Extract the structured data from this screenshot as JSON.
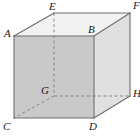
{
  "figure": {
    "name": "labelled-rectangular-box",
    "type": "geometry-diagram",
    "projection": "oblique",
    "canvas": {
      "width": 140,
      "height": 138
    },
    "colors": {
      "background": "#ffffff",
      "front_face": "#c9c9c9",
      "top_face": "#f2f2f2",
      "right_face": "#e0e0e0",
      "edge_visible": "#6e6e6e",
      "edge_hidden": "#8a8a8a",
      "label_text": "#1a1a1a"
    },
    "vertices": [
      {
        "id": "A",
        "label": "A",
        "x": 14,
        "y": 36,
        "hidden": false,
        "label_x": 4,
        "label_y": 28
      },
      {
        "id": "B",
        "label": "B",
        "x": 94,
        "y": 36,
        "hidden": false,
        "label_x": 88,
        "label_y": 24
      },
      {
        "id": "C",
        "label": "C",
        "x": 14,
        "y": 118,
        "hidden": false,
        "label_x": 3,
        "label_y": 121
      },
      {
        "id": "D",
        "label": "D",
        "x": 94,
        "y": 118,
        "hidden": false,
        "label_x": 89,
        "label_y": 121
      },
      {
        "id": "E",
        "label": "E",
        "x": 54,
        "y": 13,
        "hidden": false,
        "label_x": 49,
        "label_y": 1
      },
      {
        "id": "F",
        "label": "F",
        "x": 130,
        "y": 13,
        "hidden": false,
        "label_x": 133,
        "label_y": 0
      },
      {
        "id": "G",
        "label": "G",
        "x": 54,
        "y": 96,
        "hidden": true,
        "label_x": 41,
        "label_y": 85
      },
      {
        "id": "H",
        "label": "H",
        "x": 130,
        "y": 96,
        "hidden": false,
        "label_x": 133,
        "label_y": 88
      }
    ],
    "edges_visible": [
      {
        "from": "A",
        "to": "B",
        "name": "edge-a-b"
      },
      {
        "from": "B",
        "to": "D",
        "name": "edge-b-d"
      },
      {
        "from": "D",
        "to": "C",
        "name": "edge-d-c"
      },
      {
        "from": "C",
        "to": "A",
        "name": "edge-c-a"
      },
      {
        "from": "A",
        "to": "E",
        "name": "edge-a-e"
      },
      {
        "from": "B",
        "to": "F",
        "name": "edge-b-f"
      },
      {
        "from": "E",
        "to": "F",
        "name": "edge-e-f"
      },
      {
        "from": "D",
        "to": "H",
        "name": "edge-d-h"
      },
      {
        "from": "F",
        "to": "H",
        "name": "edge-f-h"
      }
    ],
    "edges_hidden": [
      {
        "from": "E",
        "to": "G",
        "name": "edge-e-g-dashed"
      },
      {
        "from": "G",
        "to": "C",
        "name": "edge-g-c-dashed"
      },
      {
        "from": "G",
        "to": "H",
        "name": "edge-g-h-dashed"
      }
    ],
    "faces": [
      {
        "name": "front-face",
        "vertices": [
          "A",
          "B",
          "D",
          "C"
        ],
        "fill": "#c9c9c9"
      },
      {
        "name": "top-face",
        "vertices": [
          "A",
          "E",
          "F",
          "B"
        ],
        "fill": "#f2f2f2"
      },
      {
        "name": "right-face",
        "vertices": [
          "B",
          "F",
          "H",
          "D"
        ],
        "fill": "#e0e0e0"
      }
    ]
  }
}
